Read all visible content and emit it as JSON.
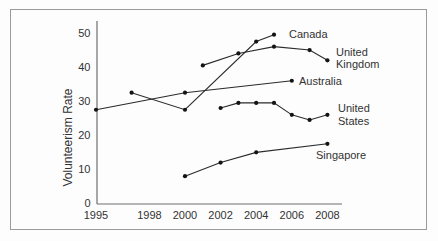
{
  "window": {
    "background": "#fdfdfd",
    "frame_border_color": "#9a9a9a"
  },
  "colors": {
    "line": "#2b2b2b",
    "point": "#141414",
    "axis": "#6e6e6e",
    "text": "#333333"
  },
  "chart_data": {
    "type": "line",
    "title": "",
    "xlabel": "",
    "ylabel": "Volunteerism Rate",
    "x_ticks": [
      1995,
      1998,
      2000,
      2002,
      2004,
      2006,
      2008
    ],
    "y_ticks": [
      0,
      10,
      20,
      30,
      40,
      50
    ],
    "xlim": [
      1995,
      2008.8
    ],
    "ylim": [
      0,
      50
    ],
    "grid": false,
    "legend": "inline-labels-at-line-ends",
    "series": [
      {
        "name": "Canada",
        "label_lines": [
          "Canada"
        ],
        "points": [
          [
            1997,
            32.5
          ],
          [
            2000,
            27.5
          ],
          [
            2004,
            47.5
          ],
          [
            2005,
            49.5
          ]
        ]
      },
      {
        "name": "United Kingdom",
        "label_lines": [
          "United",
          "Kingdom"
        ],
        "points": [
          [
            2001,
            40.5
          ],
          [
            2003,
            44
          ],
          [
            2005,
            46
          ],
          [
            2007,
            45
          ],
          [
            2008,
            42
          ]
        ]
      },
      {
        "name": "Australia",
        "label_lines": [
          "Australia"
        ],
        "points": [
          [
            1995,
            27.5
          ],
          [
            2000,
            32.5
          ],
          [
            2006,
            36
          ]
        ]
      },
      {
        "name": "United States",
        "label_lines": [
          "United",
          "States"
        ],
        "points": [
          [
            2002,
            28
          ],
          [
            2003,
            29.5
          ],
          [
            2004,
            29.5
          ],
          [
            2005,
            29.5
          ],
          [
            2006,
            26
          ],
          [
            2007,
            24.5
          ],
          [
            2008,
            26
          ]
        ]
      },
      {
        "name": "Singapore",
        "label_lines": [
          "Singapore"
        ],
        "points": [
          [
            2000,
            8
          ],
          [
            2002,
            12
          ],
          [
            2004,
            15
          ],
          [
            2008,
            17.5
          ]
        ]
      }
    ]
  }
}
